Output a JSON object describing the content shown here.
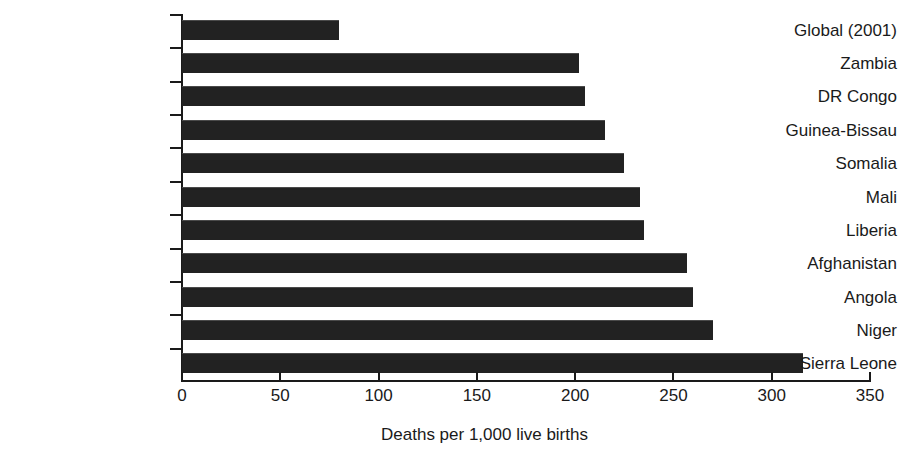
{
  "chart_data": {
    "type": "bar",
    "orientation": "horizontal",
    "title": "",
    "subtitle": "",
    "xlabel": "Deaths per 1,000 live births",
    "ylabel": "",
    "xlim": [
      0,
      350
    ],
    "xticks": [
      0,
      50,
      100,
      150,
      200,
      250,
      300,
      350
    ],
    "xtick_labels": [
      "0",
      "50",
      "100",
      "150",
      "200",
      "250",
      "300",
      "350"
    ],
    "grid": false,
    "legend": false,
    "legend_position": "none",
    "bar_color": "#222222",
    "categories": [
      "Global (2001)",
      "Zambia",
      "DR Congo",
      "Guinea-Bissau",
      "Somalia",
      "Mali",
      "Liberia",
      "Afghanistan",
      "Angola",
      "Niger",
      "Sierra Leone"
    ],
    "values": [
      80,
      202,
      205,
      215,
      225,
      233,
      235,
      257,
      260,
      270,
      316
    ],
    "series": [
      {
        "name": "Under-five mortality rate",
        "values": [
          80,
          202,
          205,
          215,
          225,
          233,
          235,
          257,
          260,
          270,
          316
        ]
      }
    ]
  }
}
